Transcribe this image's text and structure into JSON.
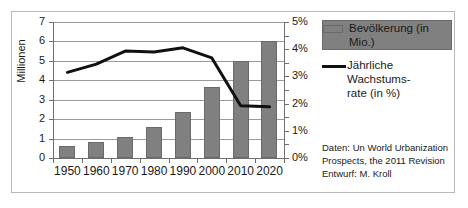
{
  "chart_data": {
    "type": "bar",
    "title": "",
    "subtitle": "",
    "categories": [
      "1950",
      "1960",
      "1970",
      "1980",
      "1990",
      "2000",
      "2010",
      "2020"
    ],
    "xlabel": "",
    "ylabel": "Millionen",
    "ylabel_right": "",
    "ylim": [
      0,
      7
    ],
    "ylim_right": [
      0,
      5
    ],
    "grid": true,
    "legend_position": "right",
    "series": [
      {
        "name": "Bevölkerung (in Mio.)",
        "type": "bar",
        "axis": "left",
        "unit": "Mio.",
        "color": "#808080",
        "values": [
          0.6,
          0.8,
          1.1,
          1.58,
          2.35,
          3.65,
          4.98,
          6.02
        ]
      },
      {
        "name": "Jährliche Wachstumsrate (in %)",
        "type": "line",
        "axis": "right",
        "unit": "%",
        "color": "#101010",
        "values": [
          3.15,
          3.45,
          3.93,
          3.9,
          4.05,
          3.68,
          1.92,
          1.88
        ]
      }
    ],
    "yticks_left": [
      "0",
      "1",
      "2",
      "3",
      "4",
      "5",
      "6",
      "7"
    ],
    "yticks_right": [
      "0%",
      "1%",
      "2%",
      "3%",
      "4%",
      "5%"
    ]
  },
  "legend": {
    "items": [
      {
        "label": "Bevölkerung (in Mio.)",
        "marker": "bar-swatch",
        "color": "#808080"
      },
      {
        "label": "Jährliche Wachstums-\nrate (in %)",
        "marker": "line-swatch",
        "color": "#101010"
      }
    ]
  },
  "source": {
    "line1": "Daten: Un World Urbanization",
    "line2": "Prospects, the 2011 Revision",
    "line3": "Entwurf: M. Kroll"
  }
}
